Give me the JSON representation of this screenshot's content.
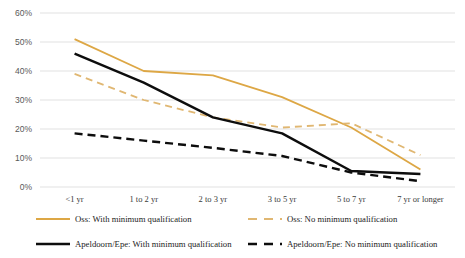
{
  "chart_data": {
    "type": "line",
    "title": "",
    "xlabel": "",
    "ylabel": "",
    "ylim": [
      0,
      60
    ],
    "ytick_labels": [
      "60%",
      "50%",
      "40%",
      "30%",
      "20%",
      "10%",
      "0%"
    ],
    "ytick_values": [
      60,
      50,
      40,
      30,
      20,
      10,
      0
    ],
    "grid": true,
    "legend_position": "bottom",
    "categories": [
      "<1 yr",
      "1 to 2 yr",
      "2 to 3 yr",
      "3 to 5 yr",
      "5 to 7 yr",
      "7 yr or longer"
    ],
    "series": [
      {
        "name": "Oss: With minimum qualification",
        "color": "#DDA745",
        "style": "solid",
        "values": [
          51,
          40,
          38.5,
          31,
          20.5,
          6
        ]
      },
      {
        "name": "Oss: No minimum qualification",
        "color": "#E0B772",
        "style": "dashed",
        "values": [
          39,
          30,
          24,
          20.5,
          22,
          11
        ]
      },
      {
        "name": "Apeldoorn/Epe: With minimum qualification",
        "color": "#0D0D0D",
        "style": "solid",
        "values": [
          46,
          36,
          24,
          18.5,
          5.5,
          4.5
        ]
      },
      {
        "name": "Apeldoorn/Epe: No minimum qualification",
        "color": "#0D0D0D",
        "style": "dashed",
        "values": [
          18.5,
          16,
          13.5,
          10.7,
          5,
          2
        ]
      }
    ]
  },
  "legend": {
    "items": [
      "Oss: With minimum qualification",
      "Oss: No minimum qualification",
      "Apeldoorn/Epe: With minimum qualification",
      "Apeldoorn/Epe: No minimum qualification"
    ]
  }
}
